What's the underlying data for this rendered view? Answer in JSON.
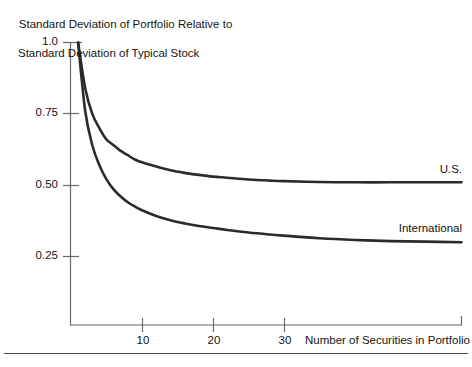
{
  "figure": {
    "y_axis_title_line1": "Standard Deviation of Portfolio Relative to",
    "y_axis_title_line2": "Standard Deviation of Typical Stock",
    "x_axis_title": "Number of Securities in Portfolio",
    "axis_color": "#6b6b6b",
    "curve_color": "#2b2b2b",
    "rule_color": "#4a4a4a"
  },
  "chart_data": {
    "type": "line",
    "title": "",
    "subtitle": "",
    "xlabel": "Number of Securities in Portfolio",
    "ylabel": "Standard Deviation of Portfolio Relative to Standard Deviation of Typical Stock",
    "xlim": [
      0,
      55
    ],
    "ylim": [
      0,
      1.0
    ],
    "xticks": [
      10,
      20,
      30
    ],
    "xtick_labels": [
      "10",
      "20",
      "30"
    ],
    "yticks": [
      0.25,
      0.5,
      0.75,
      1.0
    ],
    "ytick_labels": [
      "0.25",
      "0.50",
      "0.75",
      "1.0"
    ],
    "grid": false,
    "legend": "inline-annotations",
    "x": [
      1,
      2,
      3,
      4,
      5,
      6,
      7,
      8,
      9,
      10,
      12,
      14,
      16,
      18,
      20,
      22,
      25,
      28,
      30,
      35,
      40,
      45,
      50,
      55
    ],
    "series": [
      {
        "name": "U.S.",
        "asymptote": 0.51,
        "values": [
          1.0,
          0.84,
          0.75,
          0.7,
          0.66,
          0.64,
          0.62,
          0.605,
          0.59,
          0.58,
          0.565,
          0.552,
          0.543,
          0.536,
          0.53,
          0.526,
          0.52,
          0.516,
          0.514,
          0.511,
          0.51,
          0.51,
          0.51,
          0.51
        ]
      },
      {
        "name": "International",
        "asymptote": 0.3,
        "values": [
          1.0,
          0.76,
          0.64,
          0.57,
          0.52,
          0.485,
          0.46,
          0.44,
          0.425,
          0.412,
          0.392,
          0.377,
          0.366,
          0.357,
          0.35,
          0.343,
          0.334,
          0.327,
          0.323,
          0.314,
          0.308,
          0.304,
          0.302,
          0.3
        ]
      }
    ],
    "annotations": [
      {
        "text": "U.S.",
        "x": 47,
        "y": 0.545
      },
      {
        "text": "International",
        "x": 44,
        "y": 0.345
      }
    ]
  }
}
